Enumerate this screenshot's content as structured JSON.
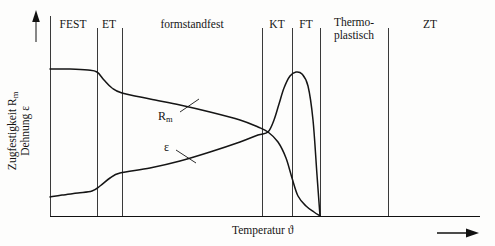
{
  "figure": {
    "axes": {
      "y_label_line1": "Zugfestigkeit R",
      "y_label_line1_sub": "m",
      "y_label_line2": "Dehnung ε",
      "x_label": "Temperatur ϑ",
      "y_arrow_icon": "up-arrow-icon",
      "x_arrow_icon": "right-arrow-icon"
    },
    "zones": [
      {
        "label": "FEST",
        "x_start": 50,
        "x_end": 97,
        "label_x": 73,
        "label_y": 18,
        "lines": [
          "FEST"
        ]
      },
      {
        "label": "ET",
        "x_start": 97,
        "x_end": 122,
        "label_x": 109,
        "label_y": 18,
        "lines": [
          "ET"
        ]
      },
      {
        "label": "formstandfest",
        "x_start": 122,
        "x_end": 262,
        "label_x": 192,
        "label_y": 18,
        "lines": [
          "formstandfest"
        ]
      },
      {
        "label": "KT",
        "x_start": 262,
        "x_end": 292,
        "label_x": 277,
        "label_y": 18,
        "lines": [
          "KT"
        ]
      },
      {
        "label": "FT",
        "x_start": 292,
        "x_end": 320,
        "label_x": 306,
        "label_y": 18,
        "lines": [
          "FT"
        ]
      },
      {
        "label": "Thermoplastisch",
        "x_start": 320,
        "x_end": 388,
        "label_x": 354,
        "label_y": 16,
        "lines": [
          "Thermo-",
          "plastisch"
        ]
      },
      {
        "label": "ZT",
        "x_start": 388,
        "x_end": 480,
        "label_x": 430,
        "label_y": 18,
        "lines": [
          "ZT"
        ]
      }
    ],
    "curves": [
      {
        "name": "Rm",
        "label": "R",
        "label_sub": "m",
        "label_x": 158,
        "label_y": 110,
        "leader": {
          "x1": 180,
          "y1": 112,
          "x2": 199,
          "y2": 99
        }
      },
      {
        "name": "epsilon",
        "label": "ε",
        "label_sub": "",
        "label_x": 164,
        "label_y": 141,
        "leader": {
          "x1": 176,
          "y1": 150,
          "x2": 196,
          "y2": 163
        }
      }
    ]
  },
  "chart_data": {
    "type": "line",
    "title": "",
    "xlabel": "Temperatur ϑ",
    "ylabel": "Zugfestigkeit Rm / Dehnung ε",
    "xlim": [
      50,
      480
    ],
    "ylim": [
      216,
      40
    ],
    "grid": false,
    "legend": "inline-curve-labels",
    "annotations": [
      "FEST",
      "ET",
      "formstandfest",
      "KT",
      "FT",
      "Thermo-plastisch",
      "ZT"
    ],
    "zone_boundaries_px": [
      50,
      97,
      122,
      262,
      292,
      320,
      388
    ],
    "series": [
      {
        "name": "Rm",
        "points": [
          [
            50,
            69
          ],
          [
            70,
            69
          ],
          [
            88,
            70
          ],
          [
            97,
            72
          ],
          [
            104,
            80
          ],
          [
            112,
            88
          ],
          [
            122,
            93
          ],
          [
            150,
            99
          ],
          [
            180,
            105
          ],
          [
            210,
            112
          ],
          [
            240,
            120
          ],
          [
            258,
            127
          ],
          [
            268,
            132
          ],
          [
            278,
            142
          ],
          [
            286,
            158
          ],
          [
            292,
            178
          ],
          [
            298,
            196
          ],
          [
            306,
            206
          ],
          [
            314,
            212
          ],
          [
            320,
            216
          ]
        ]
      },
      {
        "name": "epsilon",
        "points": [
          [
            50,
            197
          ],
          [
            62,
            195
          ],
          [
            78,
            193
          ],
          [
            92,
            191
          ],
          [
            100,
            186
          ],
          [
            110,
            178
          ],
          [
            120,
            173
          ],
          [
            150,
            168
          ],
          [
            180,
            161
          ],
          [
            210,
            152
          ],
          [
            240,
            142
          ],
          [
            258,
            135
          ],
          [
            268,
            132
          ],
          [
            274,
            120
          ],
          [
            279,
            104
          ],
          [
            284,
            88
          ],
          [
            290,
            76
          ],
          [
            296,
            72
          ],
          [
            302,
            74
          ],
          [
            308,
            86
          ],
          [
            313,
            120
          ],
          [
            317,
            175
          ],
          [
            320,
            216
          ]
        ]
      }
    ]
  }
}
